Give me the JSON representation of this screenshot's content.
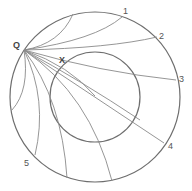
{
  "diagram": {
    "colors": {
      "stroke": "#6e6e6e",
      "curve": "#8a8a8a",
      "label": "#555555"
    },
    "outer_circle": {
      "cx": 95,
      "cy": 97,
      "r": 85
    },
    "inner_circle": {
      "cx": 95,
      "cy": 97,
      "r": 45
    },
    "points": {
      "Q": {
        "label": "Q",
        "x": 24,
        "y": 50
      },
      "X": {
        "label": "X",
        "x": 63,
        "y": 60
      }
    },
    "boundary_labels": [
      {
        "label": "1",
        "x": 125,
        "y": 13
      },
      {
        "label": "2",
        "x": 159,
        "y": 38
      },
      {
        "label": "3",
        "x": 179,
        "y": 80
      },
      {
        "label": "4",
        "x": 169,
        "y": 148
      },
      {
        "label": "5",
        "x": 25,
        "y": 165
      }
    ]
  }
}
